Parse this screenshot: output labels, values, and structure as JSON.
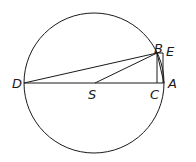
{
  "diagram": {
    "stroke_color": "#1a1a1a",
    "background": "#ffffff",
    "labels": {
      "D": "D",
      "S": "S",
      "C": "C",
      "A": "A",
      "B": "B",
      "E": "E"
    }
  }
}
